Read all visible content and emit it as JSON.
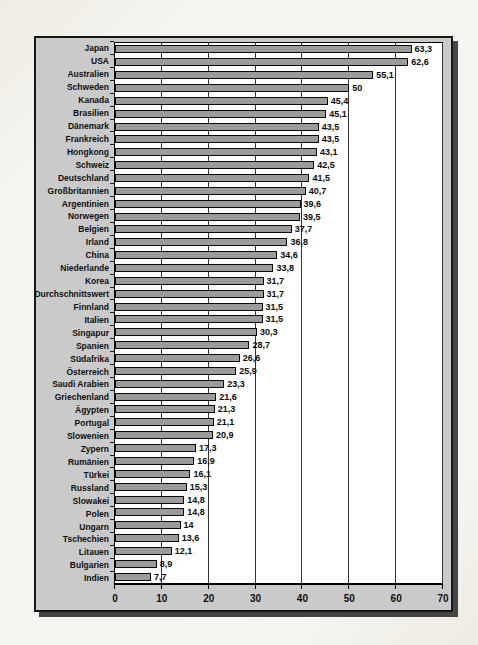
{
  "page": {
    "background_color": "#f4f1ea"
  },
  "chart_data": {
    "type": "bar",
    "orientation": "horizontal",
    "title": "",
    "xlabel": "",
    "ylabel": "",
    "xlim": [
      0,
      70
    ],
    "x_ticks": [
      0,
      10,
      20,
      30,
      40,
      50,
      60,
      70
    ],
    "x_tick_labels": [
      "0",
      "10",
      "20",
      "30",
      "40",
      "50",
      "60",
      "70"
    ],
    "grid": "vertical-on",
    "legend": "none",
    "categories": [
      "Japan",
      "USA",
      "Australien",
      "Schweden",
      "Kanada",
      "Brasilien",
      "Dänemark",
      "Frankreich",
      "Hongkong",
      "Schweiz",
      "Deutschland",
      "Großbritannien",
      "Argentinien",
      "Norwegen",
      "Belgien",
      "Irland",
      "China",
      "Niederlande",
      "Korea",
      "Durchschnittswert",
      "Finnland",
      "Italien",
      "Singapur",
      "Spanien",
      "Südafrika",
      "Österreich",
      "Saudi Arabien",
      "Griechenland",
      "Ägypten",
      "Portugal",
      "Slowenien",
      "Zypern",
      "Rumänien",
      "Türkei",
      "Russland",
      "Slowakei",
      "Polen",
      "Ungarn",
      "Tschechien",
      "Litauen",
      "Bulgarien",
      "Indien"
    ],
    "values": [
      63.3,
      62.6,
      55.1,
      50,
      45.4,
      45.1,
      43.5,
      43.5,
      43.1,
      42.5,
      41.5,
      40.7,
      39.6,
      39.5,
      37.7,
      36.8,
      34.6,
      33.8,
      31.7,
      31.7,
      31.5,
      31.5,
      30.3,
      28.7,
      26.6,
      25.9,
      23.3,
      21.6,
      21.3,
      21.1,
      20.9,
      17.3,
      16.9,
      16.1,
      15.3,
      14.8,
      14.8,
      14,
      13.6,
      12.1,
      8.9,
      7.7
    ],
    "value_labels": [
      "63,3",
      "62,6",
      "55,1",
      "50",
      "45,4",
      "45,1",
      "43,5",
      "43,5",
      "43,1",
      "42,5",
      "41,5",
      "40,7",
      "39,6",
      "39,5",
      "37,7",
      "36,8",
      "34,6",
      "33,8",
      "31,7",
      "31,7",
      "31,5",
      "31,5",
      "30,3",
      "28,7",
      "26,6",
      "25,9",
      "23,3",
      "21,6",
      "21,3",
      "21,1",
      "20,9",
      "17,3",
      "16,9",
      "16,1",
      "15,3",
      "14,8",
      "14,8",
      "14",
      "13,6",
      "12,1",
      "8,9",
      "7,7"
    ],
    "colors": {
      "bar_fill": "#9b9b9b",
      "bar_border": "#0a0a0a",
      "chart_background": "#cacaca",
      "plot_background": "#ffffff",
      "gridline": "#333333",
      "frame_border": "#171717",
      "frame_shadow": "#454545"
    }
  }
}
